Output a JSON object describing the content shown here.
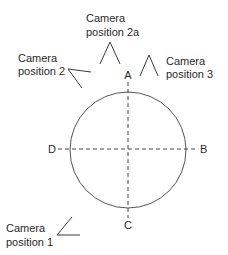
{
  "diagram": {
    "axes": {
      "top": "A",
      "right": "B",
      "bottom": "C",
      "left": "D"
    },
    "cameras": [
      {
        "id": "cam2a",
        "line1": "Camera",
        "line2": "position 2a"
      },
      {
        "id": "cam2",
        "line1": "Camera",
        "line2": "position 2"
      },
      {
        "id": "cam3",
        "line1": "Camera",
        "line2": "position 3"
      },
      {
        "id": "cam1",
        "line1": "Camera",
        "line2": "position 1"
      }
    ],
    "colors": {
      "stroke": "#444444",
      "text": "#2a2a2a",
      "background": "#ffffff"
    }
  }
}
